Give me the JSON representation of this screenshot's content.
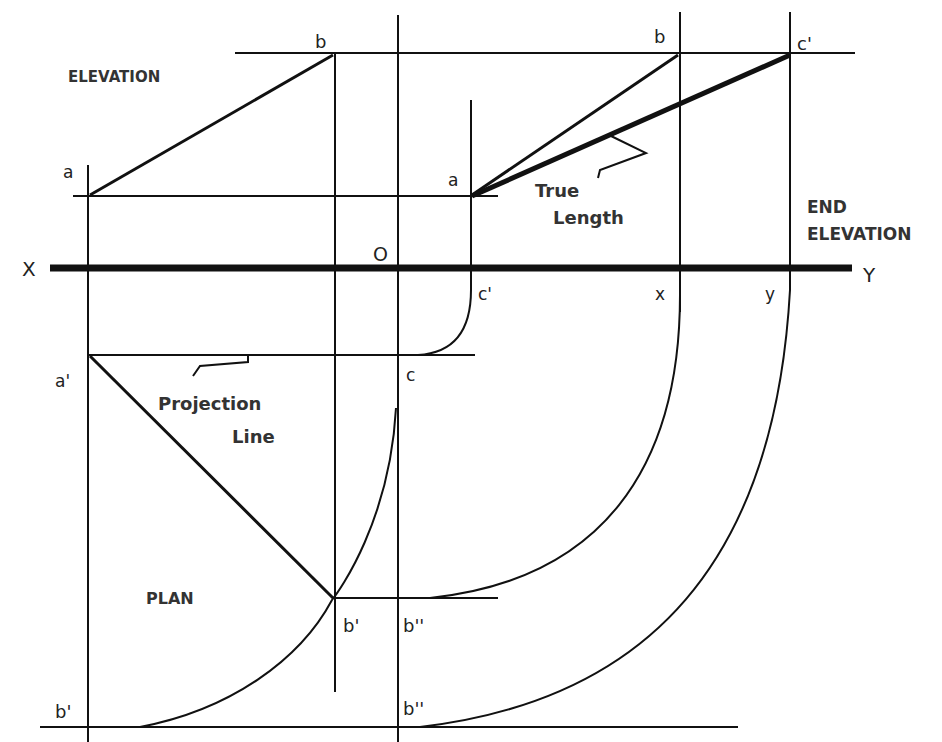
{
  "diagram": {
    "colors": {
      "line": "#111111",
      "text": "#222222",
      "background": "#ffffff"
    },
    "views": {
      "elevation_label": "ELEVATION",
      "plan_label": "PLAN",
      "end_elevation_label_line1": "END",
      "end_elevation_label_line2": "ELEVATION"
    },
    "reference_line": {
      "left_label": "X",
      "right_label": "Y",
      "origin_label": "O"
    },
    "annotations": {
      "true_length_line1": "True",
      "true_length_line2": "Length",
      "projection_line1": "Projection",
      "projection_line2": "Line"
    },
    "points": {
      "elev_a": "a",
      "elev_b": "b",
      "end_a": "a",
      "end_b": "b",
      "end_c_prime": "c'",
      "xy_c_prime": "c'",
      "xy_x": "x",
      "xy_y": "y",
      "plan_a_prime": "a'",
      "plan_c": "c",
      "plan_b_prime": "b'",
      "plan_b_double_prime": "b''",
      "bottom_b_prime": "b'",
      "bottom_b_double_prime": "b''"
    }
  }
}
